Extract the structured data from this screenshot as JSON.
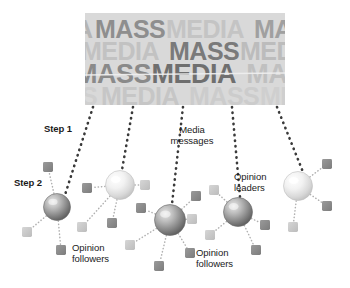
{
  "figure": {
    "background": "#ffffff"
  },
  "media_block": {
    "name": "mass-media-word-block",
    "x": 85,
    "y": 13,
    "width": 200,
    "height": 92,
    "bg": "#d9d9d9",
    "words": [
      "MASS",
      "MEDIA"
    ],
    "rows": [
      {
        "text": "A MASS MEDIA MAS",
        "y": 4,
        "size": 25,
        "tones": [
          "#b4b4b4",
          "#8e8e8e",
          "#c4c4c4",
          "#a0a0a0"
        ]
      },
      {
        "text": "MEDIA MASS MEDIA",
        "y": 26,
        "size": 25,
        "tones": [
          "#c2c2c2",
          "#7a7a7a",
          "#bcbcbc"
        ]
      },
      {
        "text": "MASS MEDIA MASS",
        "y": 48,
        "size": 27,
        "tones": [
          "#8a8a8a",
          "#6f6f6f",
          "#c0c0c0"
        ]
      },
      {
        "text": "S MEDIA MASS MED",
        "y": 71,
        "size": 25,
        "tones": [
          "#cfcfcf",
          "#c6c6c6",
          "#cccccc"
        ]
      }
    ]
  },
  "labels": [
    {
      "id": "step-1",
      "text": "Step 1",
      "x": 44,
      "y": 124,
      "style": "step",
      "align": "left"
    },
    {
      "id": "step-2",
      "text": "Step 2",
      "x": 14,
      "y": 178,
      "style": "step",
      "align": "left"
    },
    {
      "id": "media-messages",
      "text": "Media\nmessages",
      "x": 192,
      "y": 125,
      "style": "annot",
      "align": "center"
    },
    {
      "id": "opinion-leaders",
      "text": "Opinion\nleaders",
      "x": 234,
      "y": 172,
      "style": "annot",
      "align": "left"
    },
    {
      "id": "opinion-followers-left",
      "text": "Opinion\nfollowers",
      "x": 72,
      "y": 243,
      "style": "annot",
      "align": "left"
    },
    {
      "id": "opinion-followers-right",
      "text": "Opinion\nfollowers",
      "x": 196,
      "y": 248,
      "style": "annot",
      "align": "left"
    }
  ],
  "colors": {
    "sphere_dark_edge": "#5f5f5f",
    "sphere_dark_core": "#cfcfcf",
    "sphere_light_edge": "#c7c7c7",
    "sphere_light_core": "#fbfbfb",
    "square_dark": "#8c8c8c",
    "square_light": "#c9c9c9",
    "dotted_dark": "#3a3a3a",
    "dotted_light": "#b0b0b0",
    "text": "#1a1a1a"
  },
  "spheres": [
    {
      "id": "leader-1",
      "cx": 57,
      "cy": 207,
      "r": 13.5,
      "tone": "dark"
    },
    {
      "id": "leader-2",
      "cx": 120,
      "cy": 185,
      "r": 14.5,
      "tone": "light"
    },
    {
      "id": "leader-3",
      "cx": 170,
      "cy": 220,
      "r": 15.5,
      "tone": "dark"
    },
    {
      "id": "leader-4",
      "cx": 238,
      "cy": 212,
      "r": 14.5,
      "tone": "dark"
    },
    {
      "id": "leader-5",
      "cx": 298,
      "cy": 186,
      "r": 14.5,
      "tone": "light"
    }
  ],
  "squares": [
    {
      "id": "f1",
      "cx": 48,
      "cy": 167,
      "size": 10,
      "tone": "dark",
      "link": "leader-1"
    },
    {
      "id": "f2",
      "cx": 27,
      "cy": 232,
      "size": 10,
      "tone": "light",
      "link": "leader-1"
    },
    {
      "id": "f3",
      "cx": 61,
      "cy": 250,
      "size": 10,
      "tone": "dark",
      "link": "leader-1"
    },
    {
      "id": "f4",
      "cx": 87,
      "cy": 188,
      "size": 10,
      "tone": "dark",
      "link": "leader-2"
    },
    {
      "id": "f5",
      "cx": 145,
      "cy": 185,
      "size": 10,
      "tone": "light",
      "link": "leader-2"
    },
    {
      "id": "f6",
      "cx": 82,
      "cy": 227,
      "size": 10,
      "tone": "light",
      "link": "leader-2"
    },
    {
      "id": "f7",
      "cx": 112,
      "cy": 223,
      "size": 10,
      "tone": "dark",
      "link": "leader-2"
    },
    {
      "id": "f8",
      "cx": 141,
      "cy": 208,
      "size": 10,
      "tone": "dark",
      "link": "leader-3"
    },
    {
      "id": "f9",
      "cx": 196,
      "cy": 196,
      "size": 10,
      "tone": "dark",
      "link": "leader-3"
    },
    {
      "id": "f10",
      "cx": 192,
      "cy": 219,
      "size": 10,
      "tone": "light",
      "link": "leader-3"
    },
    {
      "id": "f11",
      "cx": 130,
      "cy": 245,
      "size": 10,
      "tone": "light",
      "link": "leader-3"
    },
    {
      "id": "f12",
      "cx": 159,
      "cy": 266,
      "size": 10,
      "tone": "dark",
      "link": "leader-3"
    },
    {
      "id": "f13",
      "cx": 190,
      "cy": 253,
      "size": 10,
      "tone": "dark",
      "link": "leader-3"
    },
    {
      "id": "f14",
      "cx": 214,
      "cy": 190,
      "size": 10,
      "tone": "light",
      "link": "leader-4"
    },
    {
      "id": "f15",
      "cx": 210,
      "cy": 235,
      "size": 10,
      "tone": "light",
      "link": "leader-4"
    },
    {
      "id": "f16",
      "cx": 265,
      "cy": 225,
      "size": 10,
      "tone": "dark",
      "link": "leader-4"
    },
    {
      "id": "f17",
      "cx": 256,
      "cy": 250,
      "size": 10,
      "tone": "dark",
      "link": "leader-4"
    },
    {
      "id": "f18",
      "cx": 327,
      "cy": 164,
      "size": 10,
      "tone": "dark",
      "link": "leader-5"
    },
    {
      "id": "f19",
      "cx": 327,
      "cy": 206,
      "size": 10,
      "tone": "dark",
      "link": "leader-5"
    },
    {
      "id": "f20",
      "cx": 293,
      "cy": 227,
      "size": 10,
      "tone": "light",
      "link": "leader-5"
    }
  ],
  "media_links": [
    {
      "id": "m1",
      "x1": 93,
      "y1": 107,
      "x2": 64,
      "y2": 198
    },
    {
      "id": "m2",
      "x1": 133,
      "y1": 107,
      "x2": 122,
      "y2": 170
    },
    {
      "id": "m3",
      "x1": 183,
      "y1": 107,
      "x2": 172,
      "y2": 204
    },
    {
      "id": "m4",
      "x1": 232,
      "y1": 107,
      "x2": 240,
      "y2": 197
    },
    {
      "id": "m5",
      "x1": 277,
      "y1": 107,
      "x2": 303,
      "y2": 172
    }
  ]
}
